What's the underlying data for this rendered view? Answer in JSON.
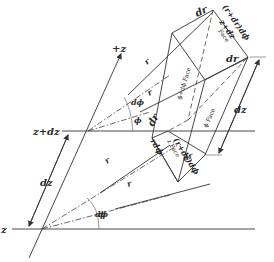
{
  "figure": {
    "colors": {
      "ink": "#333333",
      "background": "#ffffff"
    },
    "axis": {
      "label": "+z"
    },
    "levels": {
      "upper": "z+dz",
      "lower": "z"
    },
    "dimensions": {
      "left_dz": "dz",
      "right_dz": "dz"
    },
    "angles": {
      "phi": "ϕ",
      "dphi_upper": "dϕ",
      "dphi_lower": "dϕ",
      "phi_upper": "ϕ"
    },
    "radii": {
      "r_upper_1": "r",
      "r_upper_2": "r",
      "r_lower_1": "r",
      "r_lower_2": "r"
    },
    "edges": {
      "dr_top": "dr",
      "dr_right": "dr",
      "dr_front": "dr",
      "dr_bottom": "dr",
      "arc_outer_top": "(r+dr)dϕ",
      "arc_outer_front": "(r+dr)dϕ",
      "arc_inner_front": "rdϕ"
    },
    "faces": {
      "z_plus_dz": {
        "line1": "z+dz",
        "line2": "Face"
      },
      "phi_plus_dphi": "ϕ+dϕ Face",
      "phi": "ϕ Face",
      "z": "z Face"
    }
  }
}
